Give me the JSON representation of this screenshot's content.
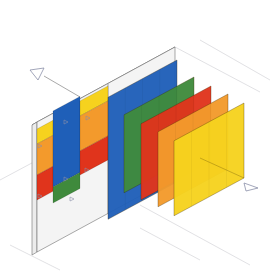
{
  "diagram": {
    "title": "",
    "type": "isometric-exploded-layers",
    "background": "#ffffff",
    "colors": {
      "blue": "#1f5fb8",
      "green": "#3f8a3c",
      "red": "#e0341c",
      "orange": "#f39a2c",
      "yellow": "#f6d21e",
      "wall": "#f4f4f4",
      "line": "#6e6e6e",
      "guide": "#d4d4d8",
      "marker": "#8a8fa8"
    },
    "wall": {
      "front_top_left": [
        37,
        122
      ],
      "front_top_right": [
        175,
        47
      ],
      "front_bottom_right": [
        175,
        177
      ],
      "front_bottom_left": [
        37,
        252
      ],
      "depth_offset": [
        -5,
        3
      ],
      "divider_x": 108
    },
    "wall_blocks": [
      {
        "name": "yellow-block-left",
        "color": "yellow",
        "x1": 37,
        "x2": 53,
        "ytop": 129,
        "h": 15
      },
      {
        "name": "orange-block-left",
        "color": "orange",
        "x1": 37,
        "x2": 53,
        "ytop": 144,
        "h": 31
      },
      {
        "name": "red-block-left",
        "color": "red",
        "x1": 37,
        "x2": 53,
        "ytop": 175,
        "h": 25
      },
      {
        "name": "blue-block-left",
        "color": "blue",
        "x1": 53,
        "x2": 80,
        "ytop": 111,
        "h": 76
      },
      {
        "name": "green-block-left",
        "color": "green",
        "x1": 53,
        "x2": 80,
        "ytop": 187,
        "h": 16
      },
      {
        "name": "yellow-block-mid",
        "color": "yellow",
        "x1": 80,
        "x2": 108,
        "ytop": 101,
        "h": 15
      },
      {
        "name": "orange-block-mid",
        "color": "orange",
        "x1": 80,
        "x2": 108,
        "ytop": 116,
        "h": 35
      },
      {
        "name": "red-block-mid",
        "color": "red",
        "x1": 80,
        "x2": 108,
        "ytop": 151,
        "h": 24
      }
    ],
    "panels": [
      {
        "name": "blue-panel",
        "color": "blue",
        "x1": 108,
        "x2": 177,
        "top_right_y": 60,
        "h": 122
      },
      {
        "name": "green-panel",
        "color": "green",
        "x1": 124,
        "x2": 194,
        "top_right_y": 77,
        "h": 78
      },
      {
        "name": "red-panel",
        "color": "red",
        "x1": 141,
        "x2": 211,
        "top_right_y": 86,
        "h": 76
      },
      {
        "name": "orange-panel",
        "color": "orange",
        "x1": 158,
        "x2": 228,
        "top_right_y": 94,
        "h": 75
      },
      {
        "name": "yellow-panel",
        "color": "yellow",
        "x1": 174,
        "x2": 244,
        "top_right_y": 103,
        "h": 75
      }
    ],
    "slope": -0.54,
    "markers": [
      {
        "name": "section-arrow-top-left",
        "at": [
          40,
          74
        ],
        "dir": "left"
      },
      {
        "name": "section-arrow-bottom-right",
        "at": [
          250,
          186
        ],
        "dir": "right"
      }
    ]
  }
}
